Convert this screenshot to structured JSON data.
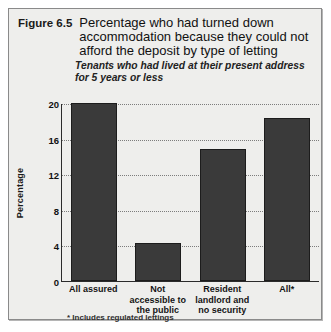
{
  "figure": {
    "number": "Figure 6.5",
    "title": "Percentage who had turned down accommodation because they could not afford the deposit by type of letting",
    "subtitle": "Tenants who had lived at their present address for 5 years or less",
    "footnote": "* Includes regulated lettings",
    "bar_color": "#3a3a3a",
    "background_color": "#eeeeec",
    "axis_color": "#2b2b2b",
    "gridline_color": "#7c7c7c"
  },
  "chart_data": {
    "type": "bar",
    "title": "Percentage who had turned down accommodation because they could not afford the deposit by type of letting",
    "subtitle": "Tenants who had lived at their present address for 5 years or less",
    "categories": [
      "All assured",
      "Not accessible to the public",
      "Resident landlord and no security",
      "All*"
    ],
    "values": [
      20.0,
      4.3,
      14.8,
      18.3
    ],
    "xlabel": "",
    "ylabel": "Percentage",
    "ylim": [
      0,
      20
    ],
    "yticks": [
      0,
      4,
      8,
      12,
      16,
      20
    ],
    "grid": true,
    "legend": false,
    "annotations": [
      "* Includes regulated lettings"
    ]
  }
}
